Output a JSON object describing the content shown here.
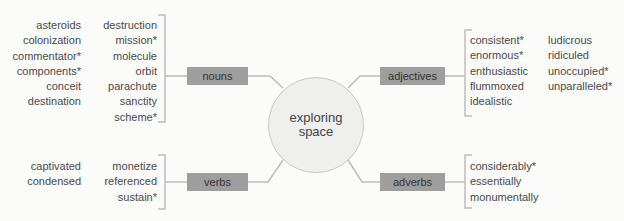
{
  "center": {
    "line1": "exploring",
    "line2": "space"
  },
  "nouns": {
    "label": "nouns",
    "col1": [
      "asteroids",
      "colonization",
      "commentator*",
      "components*",
      "conceit",
      "destination"
    ],
    "col2": [
      "destruction",
      "mission*",
      "molecule",
      "orbit",
      "parachute",
      "sanctity",
      "scheme*"
    ]
  },
  "adjectives": {
    "label": "adjectives",
    "col1": [
      "consistent*",
      "enormous*",
      "enthusiastic",
      "flummoxed",
      "idealistic"
    ],
    "col2": [
      "ludicrous",
      "ridiculed",
      "unoccupied*",
      "unparalleled*"
    ]
  },
  "verbs": {
    "label": "verbs",
    "col1": [
      "captivated",
      "condensed"
    ],
    "col2": [
      "monetize",
      "referenced",
      "sustain*"
    ]
  },
  "adverbs": {
    "label": "adverbs",
    "col1": [
      "considerably*",
      "essentially",
      "monumentally"
    ]
  }
}
